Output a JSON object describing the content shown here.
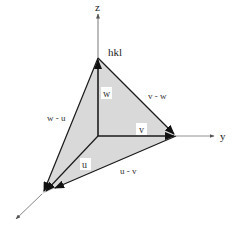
{
  "diagram": {
    "axes": {
      "z_label": "z",
      "y_label": "y"
    },
    "vertex_label": "hkl",
    "vectors": {
      "w": "w",
      "v": "v",
      "u": "u"
    },
    "edges": {
      "v_minus_w": "v - w",
      "w_minus_u": "w - u",
      "u_minus_v": "u - v"
    },
    "colors": {
      "plane_fill": "#d9d9d9",
      "edge_stroke": "#1a1a1a",
      "axis_stroke": "#555555",
      "label_box": "#ffffff"
    }
  }
}
